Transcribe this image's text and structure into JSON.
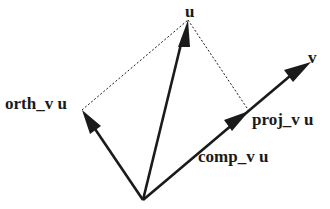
{
  "diagram": {
    "type": "vector-projection",
    "colors": {
      "stroke": "#1a1a1a",
      "background": "#ffffff"
    },
    "origin": [
      143,
      200
    ],
    "vectors": [
      {
        "id": "u",
        "label": "u",
        "tip": [
          188,
          20
        ],
        "style": "solid-arrow"
      },
      {
        "id": "v",
        "label": "v",
        "tip": [
          311,
          62
        ],
        "style": "solid-arrow"
      },
      {
        "id": "orth",
        "label": "orth_v u",
        "tip": [
          82,
          110
        ],
        "style": "solid-arrow"
      },
      {
        "id": "proj",
        "label": "proj_v u",
        "tip": [
          248,
          113
        ],
        "style": "solid-arrow"
      }
    ],
    "dashed_lines": [
      {
        "from": "orth_tip",
        "to": "u_tip"
      },
      {
        "from": "u_tip",
        "to": "proj_tip"
      }
    ],
    "labels": {
      "u": "u",
      "v": "v",
      "orth": "orth_v u",
      "proj": "proj_v u",
      "comp": "comp_v u"
    }
  }
}
